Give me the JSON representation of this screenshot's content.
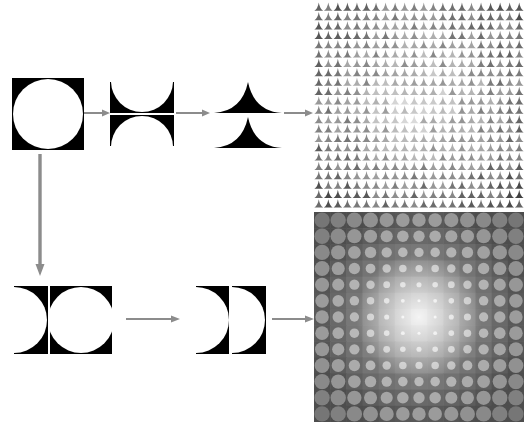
{
  "figure": {
    "background_color": "#ffffff",
    "width": 526,
    "height": 439,
    "caption": "",
    "caption_note": "caption text clipped at bottom edge of screenshot",
    "ink_color": "#000000",
    "arrow_color": "#8c8c8c"
  },
  "rows": {
    "top": {
      "label": "horizontal-split-chain",
      "steps": [
        {
          "id": "tile-circle-in-square",
          "shape_name": "circle-in-square",
          "description": "black square with inscribed white circle",
          "x": 12,
          "y": 78,
          "w": 72,
          "h": 72
        },
        {
          "id": "tile-half-swap-vertical",
          "shape_name": "half-swapped-vertical",
          "description": "square split into top and bottom halves, halves exchanged",
          "x": 110,
          "y": 82,
          "w": 64,
          "h": 64
        },
        {
          "id": "tile-spikes-stacked",
          "shape_name": "double-spike",
          "description": "two concave spike silhouettes stacked vertically",
          "x": 212,
          "y": 82,
          "w": 70,
          "h": 66
        }
      ],
      "arrows": [
        {
          "id": "arrow-top-1",
          "direction": "right",
          "x": 84,
          "y": 108,
          "w": 26,
          "h": 10
        },
        {
          "id": "arrow-top-2",
          "direction": "right",
          "x": 176,
          "y": 108,
          "w": 34,
          "h": 10
        },
        {
          "id": "arrow-top-3",
          "direction": "right",
          "x": 283,
          "y": 108,
          "w": 30,
          "h": 10
        }
      ]
    },
    "bottom": {
      "label": "vertical-split-chain",
      "steps": [
        {
          "id": "tile-half-swap-horizontal",
          "shape_name": "half-swapped-horizontal",
          "description": "square split into left and right halves, halves exchanged",
          "x": 14,
          "y": 286,
          "w": 94,
          "h": 68
        },
        {
          "id": "tile-crescents",
          "shape_name": "double-crescent",
          "description": "two crescent/lens silhouettes side by side",
          "x": 196,
          "y": 286,
          "w": 68,
          "h": 68
        }
      ],
      "arrows": [
        {
          "id": "arrow-bottom-1",
          "direction": "right",
          "x": 126,
          "y": 314,
          "w": 54,
          "h": 10
        },
        {
          "id": "arrow-bottom-2",
          "direction": "right",
          "x": 272,
          "y": 314,
          "w": 42,
          "h": 10
        }
      ]
    },
    "connector": {
      "id": "arrow-down-connector",
      "direction": "down",
      "x": 36,
      "y": 156,
      "w": 10,
      "h": 118
    }
  },
  "panels": [
    {
      "id": "panel-texture-spikes",
      "name": "spike-texture-field",
      "description": "dense grayscale field of small spike motifs, darker toward edges and lower area",
      "x": 314,
      "y": 2,
      "w": 210,
      "h": 206,
      "motif": "spike",
      "grid_cols": 22,
      "grid_rows": 22,
      "base_color": "#9a9a9a",
      "dark_color": "#111111",
      "light_color": "#f2f2f2",
      "noise": "high"
    },
    {
      "id": "panel-texture-lenses",
      "name": "lens-texture-field",
      "description": "smooth grayscale grid of lens/circle motifs shrinking toward the bright center",
      "x": 314,
      "y": 212,
      "w": 210,
      "h": 210,
      "motif": "lens",
      "grid_cols": 13,
      "grid_rows": 13,
      "base_color": "#9b9b9b",
      "dark_color": "#6a6a6a",
      "light_color": "#fbfbfb",
      "noise": "none"
    }
  ]
}
